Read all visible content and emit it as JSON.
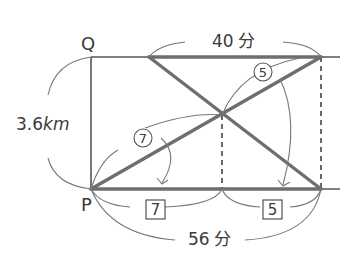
{
  "diagram": {
    "type": "distance-time diagram (travel problem)",
    "points": {
      "top_left": "Q",
      "bottom_left": "P"
    },
    "labels": {
      "distance": "3.6",
      "distance_unit": "km",
      "top_time": "40",
      "top_time_unit": "分",
      "bottom_time": "56",
      "bottom_time_unit": "分",
      "ratio_circle_left": "7",
      "ratio_circle_right": "5",
      "ratio_box_left": "7",
      "ratio_box_right": "5"
    },
    "colors": {
      "thick_line": "#6e6e6e",
      "thin_line": "#555555",
      "text": "#3a3a3a",
      "background": "#ffffff"
    }
  }
}
